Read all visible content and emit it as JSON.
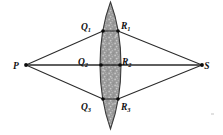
{
  "figure": {
    "background_color": "#ffffff",
    "width": 223,
    "height": 135
  },
  "labels": {
    "source": {
      "text": "P",
      "x": 16,
      "y": 69
    },
    "screen": {
      "text": "S",
      "x": 207,
      "y": 69
    },
    "q1": {
      "base": "Q",
      "sub": "1",
      "x": 86,
      "y": 30
    },
    "r1": {
      "base": "R",
      "sub": "1",
      "x": 121,
      "y": 29
    },
    "q2": {
      "base": "Q",
      "sub": "2",
      "x": 83,
      "y": 65
    },
    "r2": {
      "base": "R",
      "sub": "2",
      "x": 122,
      "y": 65
    },
    "q3": {
      "base": "Q",
      "sub": "3",
      "x": 86,
      "y": 110
    },
    "r3": {
      "base": "R",
      "sub": "3",
      "x": 121,
      "y": 110
    }
  },
  "points": {
    "P": {
      "x": 26,
      "y": 65
    },
    "S": {
      "x": 202,
      "y": 65
    },
    "Q1": {
      "x": 103,
      "y": 31
    },
    "R1": {
      "x": 118,
      "y": 31
    },
    "Q2": {
      "x": 101,
      "y": 65
    },
    "R2": {
      "x": 120,
      "y": 65
    },
    "Q3": {
      "x": 103,
      "y": 99
    },
    "R3": {
      "x": 118,
      "y": 99
    }
  },
  "lens": {
    "name": "stippled-lens-obstacle",
    "top_tip": {
      "x": 110.5,
      "y": 2
    },
    "bottom_tip": {
      "x": 110.5,
      "y": 129
    },
    "left_extreme_x": 100,
    "right_extreme_x": 121,
    "center_y": 65,
    "fill_color": "#9a9a9a",
    "speckle_color": "#c4c4c4",
    "outline_color": "#3a3a3a"
  },
  "rays": [
    {
      "name": "ray-p-q1",
      "from": "P",
      "to": "Q1"
    },
    {
      "name": "ray-p-q2",
      "from": "P",
      "to": "Q2"
    },
    {
      "name": "ray-p-q3",
      "from": "P",
      "to": "Q3"
    },
    {
      "name": "ray-r1-s",
      "from": "R1",
      "to": "S"
    },
    {
      "name": "ray-r2-s",
      "from": "R2",
      "to": "S"
    },
    {
      "name": "ray-r3-s",
      "from": "R3",
      "to": "S"
    },
    {
      "name": "chord-q1-r1",
      "from": "Q1",
      "to": "R1"
    },
    {
      "name": "chord-q2-r2",
      "from": "Q2",
      "to": "R2"
    },
    {
      "name": "chord-q3-r3",
      "from": "Q3",
      "to": "R3"
    }
  ],
  "colors": {
    "ray_stroke": "#2b2b2b",
    "node_fill": "#0b0b0b",
    "label_fill": "#111111"
  }
}
